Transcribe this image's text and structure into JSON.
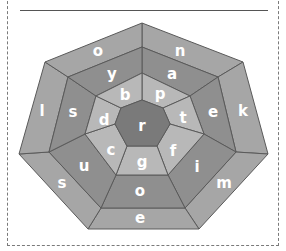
{
  "puzzle": {
    "type": "heptagon-word-wheel",
    "center_letter": "r",
    "inner_ring": [
      "p",
      "t",
      "f",
      "g",
      "c",
      "d",
      "b"
    ],
    "middle_ring": [
      "a",
      "e",
      "i",
      "o",
      "u",
      "s",
      "y"
    ],
    "outer_ring": [
      "n",
      "k",
      "m",
      "e",
      "s",
      "l",
      "o"
    ],
    "colors": {
      "center": "#7a7a7a",
      "inner_ring": "#b8b8b8",
      "middle_ring": "#8f8f8f",
      "outer_ring": "#a6a6a6",
      "stroke": "#5a5a5a",
      "letter": "#ffffff"
    }
  }
}
